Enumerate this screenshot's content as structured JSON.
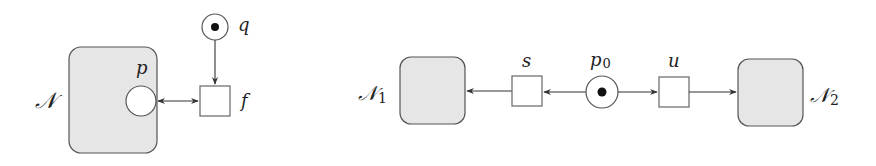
{
  "figure": {
    "left": {
      "net_label": "𝒩",
      "place_inside_label": "p",
      "transition_label": "f",
      "marked_place_label": "q"
    },
    "right": {
      "net1_label": "𝒩",
      "net1_sub": "1",
      "net2_label": "𝒩",
      "net2_sub": "2",
      "transition_left_label": "s",
      "transition_right_label": "u",
      "center_place_label": "p",
      "center_place_sub": "0"
    }
  },
  "colors": {
    "net_fill": "#e6e6e6",
    "stroke": "#555555",
    "token": "#111111"
  }
}
